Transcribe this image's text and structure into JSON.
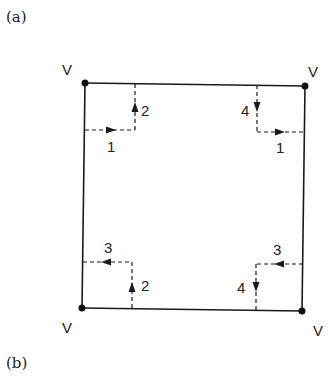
{
  "panels": {
    "a_label": "(a)",
    "b_label": "(b)"
  },
  "diagram": {
    "vertex_label": "V",
    "vertices": [
      {
        "name": "top-left",
        "label": "V"
      },
      {
        "name": "top-right",
        "label": "V"
      },
      {
        "name": "bottom-left",
        "label": "V"
      },
      {
        "name": "bottom-right",
        "label": "V"
      }
    ],
    "paths": [
      {
        "corner": "top-left",
        "horizontal_label": "1",
        "vertical_label": "2"
      },
      {
        "corner": "top-right",
        "horizontal_label": "1",
        "vertical_label": "4"
      },
      {
        "corner": "bottom-left",
        "horizontal_label": "3",
        "vertical_label": "2"
      },
      {
        "corner": "bottom-right",
        "horizontal_label": "3",
        "vertical_label": "4"
      }
    ],
    "line_color": "#1a1a1a"
  }
}
